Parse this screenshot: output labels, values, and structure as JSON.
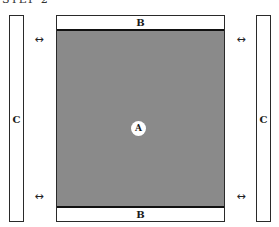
{
  "diagram": {
    "title": "STEP 2",
    "main_region_label": "A",
    "top_strip_label": "B",
    "bottom_strip_label": "B",
    "left_side_label": "C",
    "right_side_label": "C",
    "arrow_glyph": "↔",
    "colors": {
      "main_region": "#8a8a8a",
      "strips": "#ffffff",
      "outline": "#2a2a2a"
    }
  }
}
